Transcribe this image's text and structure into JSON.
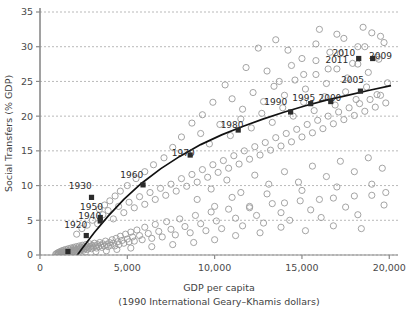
{
  "chart_data": {
    "type": "scatter",
    "title": "",
    "xlabel": "GDP per capita",
    "xlabel_sub": "(1990 International Geary–Khamis dollars)",
    "ylabel": "Social Transfers (% GDP)",
    "xlim": [
      0,
      20500
    ],
    "ylim": [
      0,
      35
    ],
    "xticks": [
      0,
      5000,
      10000,
      15000,
      20000
    ],
    "xticklabels": [
      "0",
      "5,000",
      "10,000",
      "15,000",
      "20,000"
    ],
    "yticks": [
      0,
      5,
      10,
      15,
      20,
      25,
      30,
      35
    ],
    "yticklabels": [
      "0",
      "5",
      "10",
      "15",
      "20",
      "25",
      "30",
      "35"
    ],
    "grid": "horizontal-dotted",
    "legend": "none",
    "marker_open_color": "#9a9a9a",
    "marker_highlight_color": "#2b2b2b",
    "trend_color": "#111111",
    "annotations": [
      {
        "label": "1920",
        "x": 2650,
        "y": 2.8,
        "lx": 2050,
        "ly": 4.3
      },
      {
        "label": "1940",
        "x": 3450,
        "y": 5.4,
        "lx": 2850,
        "ly": 5.5
      },
      {
        "label": "1950",
        "x": 2950,
        "y": 8.3,
        "lx": 2950,
        "ly": 6.9
      },
      {
        "label": "1930",
        "x": 2950,
        "y": 8.3,
        "lx": 2300,
        "ly": 9.9
      },
      {
        "label": "1960",
        "x": 5900,
        "y": 10.1,
        "lx": 5250,
        "ly": 11.5
      },
      {
        "label": "1970",
        "x": 8600,
        "y": 14.6,
        "lx": 8200,
        "ly": 14.6
      },
      {
        "label": "1980",
        "x": 11300,
        "y": 18.4,
        "lx": 11000,
        "ly": 18.6
      },
      {
        "label": "1990",
        "x": 14300,
        "y": 21.0,
        "lx": 13500,
        "ly": 21.9
      },
      {
        "label": "1995",
        "x": 15400,
        "y": 22.1,
        "lx": 15100,
        "ly": 22.5
      },
      {
        "label": "2000",
        "x": 16600,
        "y": 22.4,
        "lx": 16600,
        "ly": 22.6
      },
      {
        "label": "2005",
        "x": 18300,
        "y": 23.9,
        "lx": 17900,
        "ly": 25.2
      },
      {
        "label": "2009",
        "x": 19000,
        "y": 28.5,
        "lx": 19500,
        "ly": 28.6
      },
      {
        "label": "2010",
        "x": 18300,
        "y": 27.9,
        "lx": 17400,
        "ly": 29.0
      },
      {
        "label": "2011",
        "x": 18300,
        "y": 27.9,
        "lx": 17000,
        "ly": 28.0
      }
    ],
    "highlight_points": [
      {
        "x": 2650,
        "y": 2.8
      },
      {
        "x": 3450,
        "y": 5.4
      },
      {
        "x": 3450,
        "y": 4.9
      },
      {
        "x": 2950,
        "y": 8.3
      },
      {
        "x": 5900,
        "y": 10.1
      },
      {
        "x": 8600,
        "y": 14.4
      },
      {
        "x": 11350,
        "y": 18.0
      },
      {
        "x": 14350,
        "y": 20.6
      },
      {
        "x": 15500,
        "y": 21.8
      },
      {
        "x": 16650,
        "y": 22.1
      },
      {
        "x": 18350,
        "y": 23.6
      },
      {
        "x": 19050,
        "y": 28.3
      },
      {
        "x": 18250,
        "y": 28.3
      },
      {
        "x": 1600,
        "y": 0.5
      }
    ],
    "trend_curve": [
      [
        1300,
        -3.1
      ],
      [
        1800,
        -1.2
      ],
      [
        2400,
        0.9
      ],
      [
        3100,
        3.2
      ],
      [
        3900,
        5.6
      ],
      [
        4800,
        8.0
      ],
      [
        5800,
        10.3
      ],
      [
        6900,
        12.4
      ],
      [
        8000,
        14.2
      ],
      [
        9200,
        15.9
      ],
      [
        10400,
        17.3
      ],
      [
        11600,
        18.5
      ],
      [
        12800,
        19.6
      ],
      [
        14000,
        20.6
      ],
      [
        15200,
        21.5
      ],
      [
        16400,
        22.3
      ],
      [
        17600,
        23.0
      ],
      [
        18800,
        23.7
      ],
      [
        20100,
        24.4
      ]
    ],
    "points": [
      [
        900,
        0.1
      ],
      [
        950,
        0.2
      ],
      [
        1000,
        0.0
      ],
      [
        1020,
        0.3
      ],
      [
        1050,
        0.1
      ],
      [
        1080,
        0.4
      ],
      [
        1100,
        0.2
      ],
      [
        1150,
        0.0
      ],
      [
        1180,
        0.5
      ],
      [
        1200,
        0.3
      ],
      [
        1230,
        0.1
      ],
      [
        1250,
        0.6
      ],
      [
        1280,
        0.2
      ],
      [
        1300,
        0.4
      ],
      [
        1340,
        0.1
      ],
      [
        1360,
        0.7
      ],
      [
        1390,
        0.3
      ],
      [
        1420,
        0.5
      ],
      [
        1450,
        0.2
      ],
      [
        1480,
        0.8
      ],
      [
        1500,
        0.4
      ],
      [
        1530,
        0.1
      ],
      [
        1560,
        0.6
      ],
      [
        1590,
        0.3
      ],
      [
        1620,
        0.9
      ],
      [
        1650,
        0.5
      ],
      [
        1680,
        0.2
      ],
      [
        1700,
        0.7
      ],
      [
        1740,
        0.4
      ],
      [
        1770,
        1.0
      ],
      [
        1800,
        0.6
      ],
      [
        1830,
        0.3
      ],
      [
        1860,
        0.8
      ],
      [
        1890,
        0.5
      ],
      [
        1920,
        1.1
      ],
      [
        1950,
        0.7
      ],
      [
        1980,
        0.4
      ],
      [
        2010,
        0.9
      ],
      [
        2050,
        0.6
      ],
      [
        2080,
        1.2
      ],
      [
        2110,
        0.8
      ],
      [
        2140,
        0.5
      ],
      [
        2180,
        1.0
      ],
      [
        2210,
        0.7
      ],
      [
        2250,
        1.3
      ],
      [
        2280,
        0.9
      ],
      [
        2310,
        0.6
      ],
      [
        2350,
        1.1
      ],
      [
        2390,
        0.8
      ],
      [
        2420,
        1.4
      ],
      [
        2460,
        1.0
      ],
      [
        2500,
        0.7
      ],
      [
        2540,
        1.2
      ],
      [
        2580,
        0.9
      ],
      [
        2620,
        1.5
      ],
      [
        2660,
        1.1
      ],
      [
        2700,
        0.8
      ],
      [
        2750,
        1.3
      ],
      [
        2800,
        1.0
      ],
      [
        2850,
        1.6
      ],
      [
        2900,
        1.2
      ],
      [
        2950,
        0.9
      ],
      [
        3000,
        1.4
      ],
      [
        3060,
        1.1
      ],
      [
        3120,
        1.7
      ],
      [
        3180,
        1.3
      ],
      [
        3240,
        1.0
      ],
      [
        3300,
        1.5
      ],
      [
        3360,
        1.2
      ],
      [
        3420,
        1.8
      ],
      [
        3480,
        1.4
      ],
      [
        3540,
        1.1
      ],
      [
        3600,
        1.6
      ],
      [
        3680,
        1.3
      ],
      [
        3750,
        2.0
      ],
      [
        3820,
        1.5
      ],
      [
        3900,
        1.2
      ],
      [
        3980,
        1.8
      ],
      [
        4050,
        1.4
      ],
      [
        4130,
        2.2
      ],
      [
        4200,
        1.7
      ],
      [
        4280,
        1.3
      ],
      [
        4360,
        2.4
      ],
      [
        4440,
        1.9
      ],
      [
        4520,
        1.5
      ],
      [
        4600,
        2.7
      ],
      [
        4700,
        2.1
      ],
      [
        4800,
        1.7
      ],
      [
        4900,
        3.0
      ],
      [
        5000,
        2.3
      ],
      [
        5100,
        1.9
      ],
      [
        5200,
        3.3
      ],
      [
        5300,
        2.6
      ],
      [
        5400,
        2.0
      ],
      [
        5550,
        3.6
      ],
      [
        5700,
        2.8
      ],
      [
        5850,
        2.2
      ],
      [
        6000,
        4.0
      ],
      [
        6200,
        3.1
      ],
      [
        6400,
        2.4
      ],
      [
        6600,
        4.4
      ],
      [
        6800,
        3.4
      ],
      [
        7000,
        2.6
      ],
      [
        7250,
        4.8
      ],
      [
        7500,
        3.7
      ],
      [
        7750,
        2.9
      ],
      [
        8000,
        5.2
      ],
      [
        8300,
        4.1
      ],
      [
        8600,
        3.2
      ],
      [
        8900,
        5.7
      ],
      [
        9200,
        4.5
      ],
      [
        9500,
        3.5
      ],
      [
        9800,
        6.2
      ],
      [
        10100,
        4.9
      ],
      [
        10400,
        3.8
      ],
      [
        10800,
        6.6
      ],
      [
        11200,
        5.3
      ],
      [
        11600,
        4.2
      ],
      [
        12000,
        7.0
      ],
      [
        12400,
        5.7
      ],
      [
        12800,
        4.6
      ],
      [
        13300,
        7.4
      ],
      [
        13800,
        6.1
      ],
      [
        14300,
        5.0
      ],
      [
        14900,
        7.8
      ],
      [
        15500,
        6.5
      ],
      [
        16100,
        5.4
      ],
      [
        16800,
        8.2
      ],
      [
        17500,
        6.9
      ],
      [
        18200,
        5.8
      ],
      [
        19000,
        8.6
      ],
      [
        19700,
        7.2
      ],
      [
        2100,
        3.0
      ],
      [
        2400,
        3.8
      ],
      [
        2700,
        4.3
      ],
      [
        3000,
        5.0
      ],
      [
        3300,
        4.5
      ],
      [
        3600,
        5.8
      ],
      [
        3900,
        6.4
      ],
      [
        4200,
        5.2
      ],
      [
        4500,
        7.0
      ],
      [
        4800,
        6.1
      ],
      [
        5100,
        7.6
      ],
      [
        5400,
        6.8
      ],
      [
        5700,
        8.4
      ],
      [
        6000,
        7.3
      ],
      [
        6300,
        9.0
      ],
      [
        6600,
        8.0
      ],
      [
        6900,
        9.6
      ],
      [
        7200,
        8.6
      ],
      [
        7500,
        10.2
      ],
      [
        7800,
        9.2
      ],
      [
        8100,
        11.0
      ],
      [
        8400,
        9.9
      ],
      [
        8700,
        11.6
      ],
      [
        9000,
        10.5
      ],
      [
        9300,
        12.3
      ],
      [
        9600,
        11.2
      ],
      [
        9900,
        13.0
      ],
      [
        10200,
        11.9
      ],
      [
        10500,
        13.6
      ],
      [
        10800,
        12.5
      ],
      [
        11100,
        14.3
      ],
      [
        11400,
        13.1
      ],
      [
        11700,
        15.0
      ],
      [
        12000,
        13.8
      ],
      [
        12300,
        15.6
      ],
      [
        12600,
        14.4
      ],
      [
        12900,
        16.2
      ],
      [
        13200,
        15.1
      ],
      [
        13500,
        16.9
      ],
      [
        13800,
        15.7
      ],
      [
        14100,
        17.5
      ],
      [
        14400,
        16.3
      ],
      [
        14700,
        18.1
      ],
      [
        15000,
        17.0
      ],
      [
        15300,
        18.8
      ],
      [
        15600,
        17.6
      ],
      [
        15900,
        19.4
      ],
      [
        16200,
        18.2
      ],
      [
        16500,
        20.0
      ],
      [
        16800,
        18.9
      ],
      [
        17100,
        20.6
      ],
      [
        17400,
        19.5
      ],
      [
        17700,
        21.2
      ],
      [
        18000,
        20.1
      ],
      [
        18300,
        21.8
      ],
      [
        18600,
        20.7
      ],
      [
        18900,
        22.4
      ],
      [
        19200,
        21.3
      ],
      [
        19500,
        23.0
      ],
      [
        19800,
        21.9
      ],
      [
        9200,
        17.5
      ],
      [
        9700,
        16.0
      ],
      [
        10300,
        18.8
      ],
      [
        10900,
        17.2
      ],
      [
        11500,
        19.6
      ],
      [
        12100,
        18.3
      ],
      [
        12700,
        20.4
      ],
      [
        13300,
        19.1
      ],
      [
        13900,
        21.2
      ],
      [
        14500,
        20.0
      ],
      [
        15100,
        22.0
      ],
      [
        15700,
        20.8
      ],
      [
        16300,
        22.8
      ],
      [
        16900,
        21.6
      ],
      [
        17500,
        23.5
      ],
      [
        18100,
        22.4
      ],
      [
        18700,
        24.2
      ],
      [
        19300,
        23.1
      ],
      [
        19900,
        24.8
      ],
      [
        11000,
        22.5
      ],
      [
        11600,
        21.0
      ],
      [
        12200,
        23.4
      ],
      [
        12800,
        22.1
      ],
      [
        13400,
        24.3
      ],
      [
        14000,
        23.0
      ],
      [
        14600,
        25.2
      ],
      [
        15200,
        23.9
      ],
      [
        15800,
        26.0
      ],
      [
        16400,
        24.7
      ],
      [
        17000,
        26.8
      ],
      [
        17600,
        25.5
      ],
      [
        18200,
        27.5
      ],
      [
        18800,
        26.3
      ],
      [
        19400,
        28.2
      ],
      [
        13000,
        26.5
      ],
      [
        13700,
        25.0
      ],
      [
        14400,
        27.3
      ],
      [
        15100,
        26.0
      ],
      [
        15800,
        28.0
      ],
      [
        16500,
        26.8
      ],
      [
        17200,
        29.0
      ],
      [
        17900,
        27.6
      ],
      [
        18600,
        30.0
      ],
      [
        19300,
        28.5
      ],
      [
        14200,
        29.5
      ],
      [
        15000,
        28.3
      ],
      [
        15800,
        30.4
      ],
      [
        16600,
        29.2
      ],
      [
        17400,
        31.2
      ],
      [
        18200,
        30.0
      ],
      [
        19000,
        32.0
      ],
      [
        19700,
        30.6
      ],
      [
        16000,
        32.5
      ],
      [
        17000,
        31.8
      ],
      [
        18500,
        32.8
      ],
      [
        19500,
        31.5
      ],
      [
        12500,
        29.8
      ],
      [
        13500,
        31.0
      ],
      [
        11800,
        27.0
      ],
      [
        10600,
        24.5
      ],
      [
        9900,
        22.0
      ],
      [
        9300,
        20.2
      ],
      [
        8700,
        19.0
      ],
      [
        8100,
        17.0
      ],
      [
        7600,
        15.5
      ],
      [
        7100,
        14.0
      ],
      [
        6500,
        13.0
      ],
      [
        6000,
        12.0
      ],
      [
        5500,
        11.0
      ],
      [
        5000,
        10.0
      ],
      [
        4600,
        9.2
      ],
      [
        4300,
        8.5
      ],
      [
        4000,
        7.8
      ],
      [
        3700,
        7.2
      ],
      [
        3400,
        6.6
      ],
      [
        9000,
        8.0
      ],
      [
        9800,
        9.5
      ],
      [
        10700,
        10.8
      ],
      [
        11500,
        9.0
      ],
      [
        12300,
        11.5
      ],
      [
        13100,
        10.2
      ],
      [
        14000,
        12.0
      ],
      [
        14800,
        10.5
      ],
      [
        15600,
        12.8
      ],
      [
        16400,
        11.3
      ],
      [
        17200,
        13.5
      ],
      [
        18000,
        12.0
      ],
      [
        18800,
        14.0
      ],
      [
        19600,
        12.5
      ],
      [
        10000,
        7.0
      ],
      [
        11000,
        8.3
      ],
      [
        12000,
        6.8
      ],
      [
        13000,
        8.8
      ],
      [
        14000,
        7.5
      ],
      [
        15000,
        9.3
      ],
      [
        16000,
        8.0
      ],
      [
        17000,
        9.8
      ],
      [
        18000,
        8.5
      ],
      [
        19000,
        10.2
      ],
      [
        19800,
        9.0
      ],
      [
        12600,
        3.2
      ],
      [
        13800,
        4.0
      ],
      [
        15200,
        3.5
      ],
      [
        16800,
        4.2
      ],
      [
        18400,
        3.8
      ],
      [
        11200,
        2.8
      ],
      [
        10000,
        2.2
      ],
      [
        8800,
        1.8
      ],
      [
        7600,
        1.5
      ],
      [
        6400,
        1.2
      ],
      [
        5200,
        1.0
      ],
      [
        4400,
        0.8
      ],
      [
        3800,
        0.6
      ],
      [
        3200,
        0.5
      ],
      [
        2600,
        0.4
      ]
    ]
  }
}
